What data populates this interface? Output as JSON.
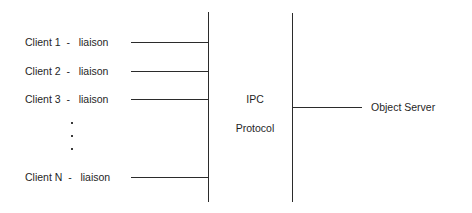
{
  "diagram": {
    "background_color": "#ffffff",
    "line_color": "#2b2b2b",
    "text_color": "#1f1f1f",
    "width": 472,
    "height": 213,
    "clients": [
      {
        "label": "Client 1  -   liaison",
        "name": "Client 1",
        "role": "liaison",
        "y": 35
      },
      {
        "label": "Client 2  -   liaison",
        "name": "Client 2",
        "role": "liaison",
        "y": 64
      },
      {
        "label": "Client 3  -   liaison",
        "name": "Client 3",
        "role": "liaison",
        "y": 92
      },
      {
        "label": "Client N  -   liaison",
        "name": "Client N",
        "role": "liaison",
        "y": 170
      }
    ],
    "ellipsis": {
      "name": "vertical-ellipsis",
      "glyph": ".",
      "dots": 3,
      "x": 71,
      "ys": [
        122,
        135,
        148
      ]
    },
    "boundaries": [
      {
        "name": "client-boundary",
        "x": 208,
        "y_top": 12,
        "y_bottom": 202
      },
      {
        "name": "server-boundary",
        "x": 292,
        "y_top": 13,
        "y_bottom": 202
      }
    ],
    "middle_band": {
      "line1": "IPC",
      "line2": "Protocol",
      "center_x": 255,
      "line1_y": 93,
      "line2_y": 122
    },
    "server": {
      "label": "Object Server",
      "label_x": 371,
      "label_y": 101,
      "connector": {
        "x_start": 292,
        "x_end": 362,
        "y": 107
      }
    }
  }
}
